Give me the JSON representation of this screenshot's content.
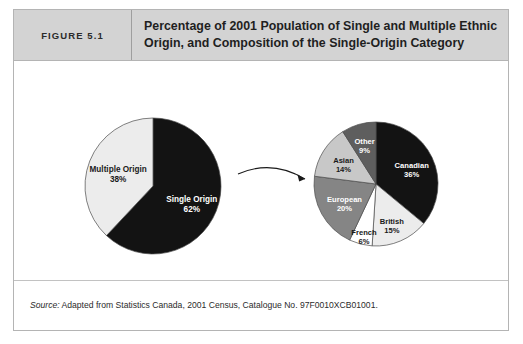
{
  "figure": {
    "number_label": "FIGURE 5.1",
    "title": "Percentage of 2001 Population of Single and Multiple Ethnic Origin, and Composition of the Single-Origin Category",
    "source_prefix": "Source:",
    "source_text": " Adapted from Statistics Canada, 2001 Census, Catalogue No. 97F0010XCB01001."
  },
  "colors": {
    "header_background": "#d3d3d3",
    "frame_border": "#b4b4b4",
    "black": "#131313",
    "near_white": "#ffffff",
    "very_light_gray": "#ececec",
    "light_gray": "#c8c8c8",
    "medium_gray": "#858585",
    "dark_gray": "#5e5e5e"
  },
  "chart_data": [
    {
      "type": "pie",
      "name": "origin-split-pie",
      "title": "",
      "categories": [
        "Single Origin",
        "Multiple Origin"
      ],
      "values": [
        62,
        38
      ],
      "unit": "%",
      "start_angle_deg": 0,
      "direction": "clockwise",
      "legend": "none",
      "slices": [
        {
          "label": "Single Origin",
          "value": 62,
          "value_text": "62%",
          "color": "#131313",
          "text_color": "#ffffff"
        },
        {
          "label": "Multiple Origin",
          "value": 38,
          "value_text": "38%",
          "color": "#ececec",
          "text_color": "#1a1a1a"
        }
      ]
    },
    {
      "type": "pie",
      "name": "single-origin-composition-pie",
      "title": "",
      "categories": [
        "Canadian",
        "British",
        "French",
        "European",
        "Asian",
        "Other"
      ],
      "values": [
        36,
        15,
        6,
        20,
        14,
        9
      ],
      "unit": "%",
      "start_angle_deg": 0,
      "direction": "clockwise",
      "legend": "none",
      "slices": [
        {
          "label": "Canadian",
          "value": 36,
          "value_text": "36%",
          "color": "#131313",
          "text_color": "#ffffff"
        },
        {
          "label": "British",
          "value": 15,
          "value_text": "15%",
          "color": "#ececec",
          "text_color": "#1a1a1a"
        },
        {
          "label": "French",
          "value": 6,
          "value_text": "6%",
          "color": "#ffffff",
          "text_color": "#1a1a1a"
        },
        {
          "label": "European",
          "value": 20,
          "value_text": "20%",
          "color": "#858585",
          "text_color": "#ffffff"
        },
        {
          "label": "Asian",
          "value": 14,
          "value_text": "14%",
          "color": "#c8c8c8",
          "text_color": "#1a1a1a"
        },
        {
          "label": "Other",
          "value": 9,
          "value_text": "9%",
          "color": "#5e5e5e",
          "text_color": "#ffffff"
        }
      ]
    }
  ],
  "annotation": {
    "arrow_name": "expansion-arrow",
    "arrow_description": "curved arrow from single-origin slice to composition pie"
  }
}
